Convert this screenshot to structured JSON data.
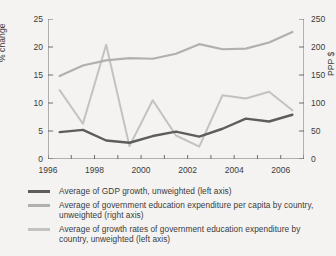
{
  "chart_data": {
    "type": "line",
    "title": "",
    "xlabel": "",
    "ylabel": "% change",
    "ylabel_right": "PPP $",
    "xlim": [
      1996,
      2007
    ],
    "ylim": [
      0,
      25
    ],
    "ylim_right": [
      0,
      250
    ],
    "grid": false,
    "legend_position": "below",
    "x": [
      1996.5,
      1997.5,
      1998.5,
      1999.5,
      2000.5,
      2001.5,
      2002.5,
      2003.5,
      2004.5,
      2005.5,
      2006.5
    ],
    "x_ticks": [
      1996,
      1997,
      1998,
      1999,
      2000,
      2001,
      2002,
      2003,
      2004,
      2005,
      2006,
      2007
    ],
    "x_tick_labels": [
      "1996",
      "",
      "1998",
      "",
      "2000",
      "",
      "2002",
      "",
      "2004",
      "",
      "2006",
      ""
    ],
    "y_ticks_left": [
      0,
      5,
      10,
      15,
      20,
      25
    ],
    "y_tick_labels_left": [
      "0",
      "5",
      "10",
      "15",
      "20",
      "25"
    ],
    "y_ticks_right": [
      0,
      50,
      100,
      150,
      200,
      250
    ],
    "y_tick_labels_right": [
      "0",
      "50",
      "100",
      "150",
      "200",
      "250"
    ],
    "series": [
      {
        "name": "Average of GDP growth, unweighted (left axis)",
        "axis": "left",
        "color": "#5d5d5d",
        "values": [
          4.8,
          5.2,
          3.3,
          2.9,
          4.1,
          4.9,
          4.0,
          5.4,
          7.2,
          6.7,
          7.9
        ]
      },
      {
        "name": "Average of government education expenditure per capita by country, unweighted (right axis)",
        "axis": "right",
        "color": "#b0b0b0",
        "values": [
          148,
          167,
          176,
          180,
          179,
          188,
          205,
          196,
          197,
          208,
          227
        ]
      },
      {
        "name": "Average of growth rates of government education expenditure by country, unweighted (left axis)",
        "axis": "left",
        "color": "#c2c2c2",
        "values": [
          12.3,
          6.3,
          20.4,
          2.3,
          10.5,
          4.2,
          2.2,
          11.4,
          10.8,
          12.0,
          8.7
        ]
      }
    ]
  },
  "legend": {
    "items": [
      {
        "label": "Average of GDP growth, unweighted (left axis)",
        "color": "#5d5d5d"
      },
      {
        "label": "Average of government education expenditure per capita by country, unweighted (right axis)",
        "color": "#b0b0b0"
      },
      {
        "label": "Average of growth rates of government education expenditure by country, unweighted (left axis)",
        "color": "#c2c2c2"
      }
    ]
  },
  "axes": {
    "left_title": "% change",
    "right_title": "PPP $",
    "axis_color": "#6e6e6e"
  }
}
